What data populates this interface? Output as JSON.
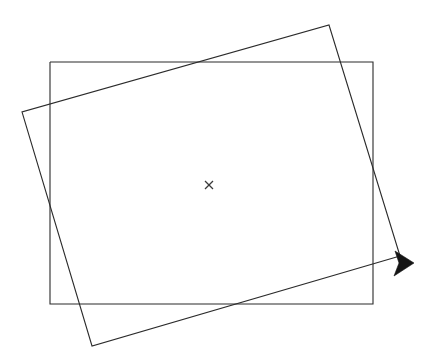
{
  "figure": {
    "width": 434,
    "height": 355,
    "background_color": "#ffffff",
    "line_color": "#2b2b2b",
    "arrow_color": "#151515",
    "center_mark_color": "#3a3a3a",
    "stroke_width": 1.1
  },
  "shapes": {
    "axis_rectangle": {
      "name": "axis-aligned-rectangle",
      "label": "Original rectangle",
      "x": 50,
      "y": 62,
      "width": 323,
      "height": 242,
      "corners": [
        [
          50,
          62
        ],
        [
          373,
          62
        ],
        [
          373,
          304
        ],
        [
          50,
          304
        ]
      ],
      "points": "50,62 373,62 373,304 50,304 50,62"
    },
    "rotated_rectangle": {
      "name": "rotated-rectangle",
      "label": "Rotated rectangle",
      "rotation_degrees": -16,
      "corners": [
        [
          22,
          112
        ],
        [
          329,
          25
        ],
        [
          412,
          262
        ],
        [
          92,
          346
        ]
      ],
      "points": "22,112 329,25 400,256 92,346 22,112",
      "open_path": "M 400,256 L 92,346 L 22,112 L 329,25 L 400,256",
      "arrow_segment_start": [
        92,
        346
      ],
      "arrow_segment_end": [
        412,
        262
      ]
    },
    "arrow_head": {
      "name": "arrow-head",
      "label": "Direction arrowhead",
      "tip": [
        414,
        262
      ],
      "points": "414,263 395,251 399,263 394,276",
      "orientation": "right"
    },
    "center_mark": {
      "name": "center-cross-mark",
      "label": "Center of rotation",
      "symbol": "×",
      "x": 209,
      "y": 185,
      "size": 8
    }
  }
}
